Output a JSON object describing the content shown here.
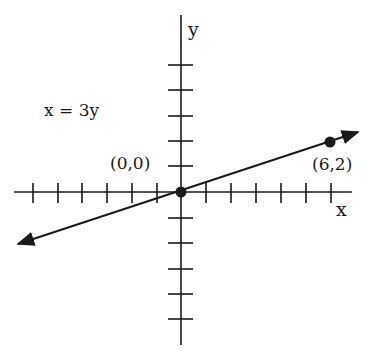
{
  "diagram": {
    "type": "coordinate-graph",
    "equation_label": "x = 3y",
    "axes": {
      "x_label": "x",
      "y_label": "y",
      "x_ticks_each_side": 6,
      "y_ticks_each_side": 5
    },
    "points": [
      {
        "label": "(0,0)",
        "x": 0,
        "y": 0
      },
      {
        "label": "(6,2)",
        "x": 6,
        "y": 2
      }
    ],
    "line": {
      "equation": "x = 3y",
      "slope": 0.3333,
      "arrows": "both"
    },
    "colors": {
      "ink": "#1a1a1a",
      "background": "#ffffff"
    }
  }
}
